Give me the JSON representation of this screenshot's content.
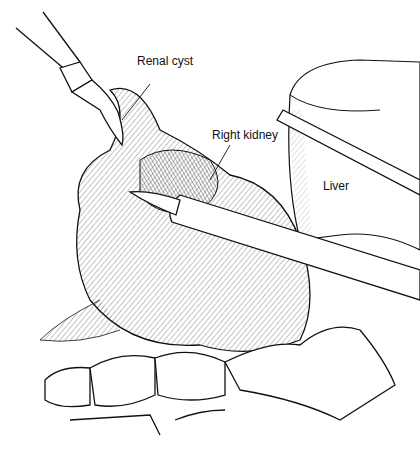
{
  "illustration": {
    "subject": "Laparoscopic excision of renal cyst",
    "labels": [
      {
        "id": "renal-cyst",
        "text": "Renal cyst"
      },
      {
        "id": "right-kidney",
        "text": "Right kidney"
      },
      {
        "id": "liver",
        "text": "Liver"
      }
    ],
    "colors": {
      "ink": "#111111",
      "background": "#ffffff",
      "hatch": "#555555"
    }
  }
}
